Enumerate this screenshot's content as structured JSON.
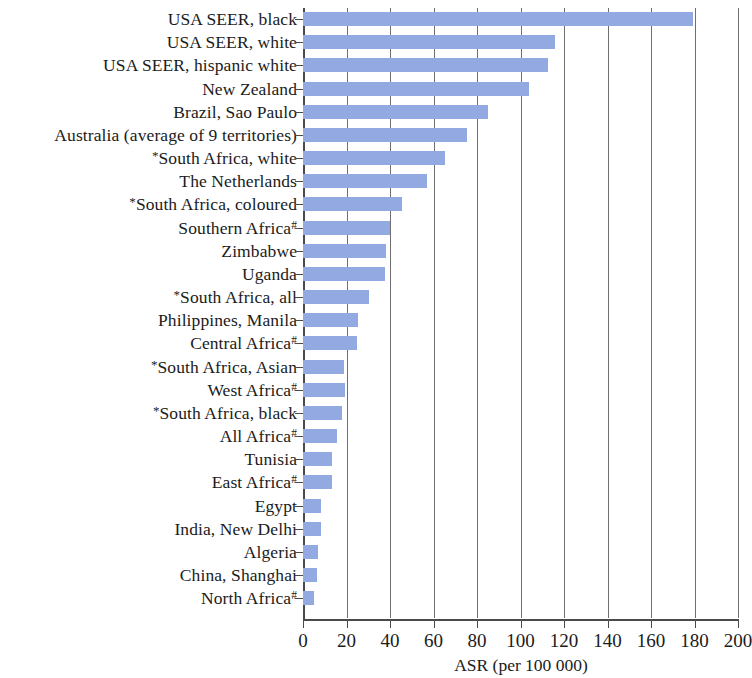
{
  "chart": {
    "type": "bar",
    "orientation": "horizontal",
    "bar_color": "#93a9e2",
    "axis_color": "#4a4a4a",
    "grid_color": "#6f6f6f",
    "grid": true,
    "legend": "none",
    "title": "",
    "xlabel": "ASR (per 100 000)",
    "ylabel": ""
  },
  "chart_data": {
    "type": "bar",
    "title": "",
    "subtitle": "",
    "xlabel": "ASR (per 100 000)",
    "ylabel": "",
    "xlim": [
      0,
      200
    ],
    "ylim": null,
    "grid": true,
    "legend_position": "none",
    "orientation": "horizontal",
    "xticks": [
      0,
      20,
      40,
      60,
      80,
      100,
      120,
      140,
      160,
      180,
      200
    ],
    "categories": [
      "USA SEER, black",
      "USA SEER, white",
      "USA SEER, hispanic white",
      "New Zealand",
      "Brazil, Sao Paulo",
      "Australia (average of 9 territories)",
      "*South Africa, white",
      "The Netherlands",
      "*South Africa, coloured",
      "Southern Africa#",
      "Zimbabwe",
      "Uganda",
      "*South Africa, all",
      "Philippines, Manila",
      "Central Africa#",
      "*South Africa, Asian",
      "West Africa#",
      "*South Africa, black",
      "All Africa#",
      "Tunisia",
      "East Africa#",
      "Egypt",
      "India, New Delhi",
      "Algeria",
      "China, Shanghai",
      "North Africa#"
    ],
    "values": [
      179.5,
      116.0,
      112.5,
      104.0,
      85.0,
      75.5,
      65.5,
      57.0,
      45.5,
      40.0,
      38.0,
      37.5,
      30.5,
      25.5,
      25.0,
      19.0,
      19.5,
      18.0,
      15.5,
      13.5,
      13.5,
      8.5,
      8.5,
      7.0,
      6.5,
      5.0
    ]
  },
  "rows": [
    {
      "label": "USA SEER, black",
      "pre": "",
      "sup": "",
      "value": 179.5
    },
    {
      "label": "USA SEER, white",
      "pre": "",
      "sup": "",
      "value": 116.0
    },
    {
      "label": "USA SEER, hispanic white",
      "pre": "",
      "sup": "",
      "value": 112.5
    },
    {
      "label": "New Zealand",
      "pre": "",
      "sup": "",
      "value": 104.0
    },
    {
      "label": "Brazil, Sao Paulo",
      "pre": "",
      "sup": "",
      "value": 85.0
    },
    {
      "label": "Australia (average of 9 territories)",
      "pre": "",
      "sup": "",
      "value": 75.5
    },
    {
      "label": "South Africa, white",
      "pre": "*",
      "sup": "",
      "value": 65.5
    },
    {
      "label": "The Netherlands",
      "pre": "",
      "sup": "",
      "value": 57.0
    },
    {
      "label": "South Africa, coloured",
      "pre": "*",
      "sup": "",
      "value": 45.5
    },
    {
      "label": "Southern Africa",
      "pre": "",
      "sup": "#",
      "value": 40.0
    },
    {
      "label": "Zimbabwe",
      "pre": "",
      "sup": "",
      "value": 38.0
    },
    {
      "label": "Uganda",
      "pre": "",
      "sup": "",
      "value": 37.5
    },
    {
      "label": "South Africa, all",
      "pre": "*",
      "sup": "",
      "value": 30.5
    },
    {
      "label": "Philippines, Manila",
      "pre": "",
      "sup": "",
      "value": 25.5
    },
    {
      "label": "Central Africa",
      "pre": "",
      "sup": "#",
      "value": 25.0
    },
    {
      "label": "South Africa, Asian",
      "pre": "*",
      "sup": "",
      "value": 19.0
    },
    {
      "label": "West Africa",
      "pre": "",
      "sup": "#",
      "value": 19.5
    },
    {
      "label": "South Africa, black",
      "pre": "*",
      "sup": "",
      "value": 18.0
    },
    {
      "label": "All Africa",
      "pre": "",
      "sup": "#",
      "value": 15.5
    },
    {
      "label": "Tunisia",
      "pre": "",
      "sup": "",
      "value": 13.5
    },
    {
      "label": "East Africa",
      "pre": "",
      "sup": "#",
      "value": 13.5
    },
    {
      "label": "Egypt",
      "pre": "",
      "sup": "",
      "value": 8.5
    },
    {
      "label": "India, New Delhi",
      "pre": "",
      "sup": "",
      "value": 8.5
    },
    {
      "label": "Algeria",
      "pre": "",
      "sup": "",
      "value": 7.0
    },
    {
      "label": "China, Shanghai",
      "pre": "",
      "sup": "",
      "value": 6.5
    },
    {
      "label": "North Africa",
      "pre": "",
      "sup": "#",
      "value": 5.0
    }
  ],
  "xaxis": {
    "ticks": [
      {
        "value": 0,
        "label": "0"
      },
      {
        "value": 20,
        "label": "20"
      },
      {
        "value": 40,
        "label": "40"
      },
      {
        "value": 60,
        "label": "60"
      },
      {
        "value": 80,
        "label": "80"
      },
      {
        "value": 100,
        "label": "100"
      },
      {
        "value": 120,
        "label": "120"
      },
      {
        "value": 140,
        "label": "140"
      },
      {
        "value": 160,
        "label": "160"
      },
      {
        "value": 180,
        "label": "180"
      },
      {
        "value": 200,
        "label": "200"
      }
    ],
    "title": "ASR (per 100 000)"
  }
}
